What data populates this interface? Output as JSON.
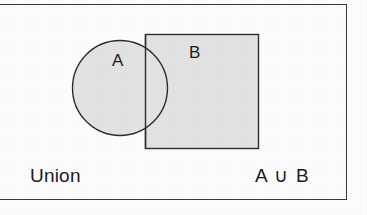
{
  "figure": {
    "caption_operation": "Union",
    "caption_expression": "A ∪ B",
    "set_a_label": "A",
    "set_b_label": "B",
    "shapes": {
      "circle": {
        "name": "set-a-circle",
        "cx": 120,
        "cy": 88,
        "r": 48
      },
      "square": {
        "name": "set-b-square",
        "x": 145,
        "y": 34,
        "width": 113,
        "height": 114
      }
    },
    "colors": {
      "fill": "#e3e3e3",
      "stroke": "#2d2d2d",
      "frame": "#3a3a3a",
      "text": "#1b1b1b",
      "background": "#fdfdfd"
    }
  }
}
